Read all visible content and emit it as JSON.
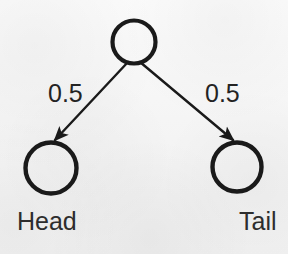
{
  "figure": {
    "kind": "probability-tree-diagram",
    "background_color": "#f4f4f4",
    "ink_color": "#1a1a1a",
    "text_color": "#2d2d2d"
  },
  "nodes": [
    {
      "id": "root",
      "label": "",
      "cx": 134,
      "cy": 42,
      "r": 22,
      "stroke_width": 4
    },
    {
      "id": "head",
      "label": "Head",
      "cx": 51,
      "cy": 168,
      "r": 26,
      "stroke_width": 4
    },
    {
      "id": "tail",
      "label": "Tail",
      "cx": 237,
      "cy": 167,
      "r": 25,
      "stroke_width": 4
    }
  ],
  "edges": [
    {
      "id": "root-to-head",
      "from": "root",
      "to": "head",
      "label": "0.5",
      "x1": 128,
      "y1": 62,
      "x2": 54,
      "y2": 139,
      "stroke_width": 2.4,
      "arrowhead": true
    },
    {
      "id": "root-to-tail",
      "from": "root",
      "to": "tail",
      "label": "0.5",
      "x1": 140,
      "y1": 62,
      "x2": 234,
      "y2": 139,
      "stroke_width": 2.4,
      "arrowhead": true
    }
  ],
  "labels": {
    "head": "Head",
    "tail": "Tail",
    "edge_left_weight": "0.5",
    "edge_right_weight": "0.5"
  }
}
